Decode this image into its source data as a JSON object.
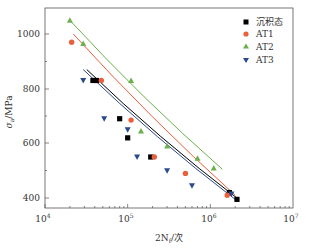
{
  "chart_data": {
    "type": "scatter",
    "title": "",
    "xlabel": "2N_f/次",
    "ylabel": "σ_a/MPa",
    "xscale": "log",
    "xlim": [
      10000,
      10000000
    ],
    "ylim": [
      375,
      1070
    ],
    "x_ticks": [
      "10^4",
      "10^5",
      "10^6",
      "10^7"
    ],
    "y_ticks": [
      400,
      600,
      800,
      1000
    ],
    "grid": false,
    "legend_position": "top-right",
    "series": [
      {
        "name": "沉积态",
        "marker": "square",
        "color": "#000000",
        "points": [
          [
            38000,
            830
          ],
          [
            42000,
            830
          ],
          [
            80000,
            690
          ],
          [
            100000,
            620
          ],
          [
            190000,
            550
          ],
          [
            1700000,
            420
          ],
          [
            2100000,
            395
          ]
        ],
        "fit": [
          [
            32000,
            870
          ],
          [
            2200000,
            395
          ]
        ]
      },
      {
        "name": "AT1",
        "marker": "circle",
        "color": "#e8603c",
        "points": [
          [
            21000,
            970
          ],
          [
            48000,
            830
          ],
          [
            110000,
            685
          ],
          [
            210000,
            550
          ],
          [
            500000,
            490
          ],
          [
            1600000,
            410
          ]
        ],
        "fit": [
          [
            22000,
            1000
          ],
          [
            2000000,
            410
          ]
        ]
      },
      {
        "name": "AT2",
        "marker": "triangle-up",
        "color": "#6ab04c",
        "points": [
          [
            20000,
            1050
          ],
          [
            29000,
            965
          ],
          [
            110000,
            830
          ],
          [
            145000,
            645
          ],
          [
            300000,
            590
          ],
          [
            700000,
            545
          ],
          [
            1100000,
            510
          ]
        ],
        "fit": [
          [
            20000,
            1050
          ],
          [
            1400000,
            505
          ]
        ]
      },
      {
        "name": "AT3",
        "marker": "triangle-down",
        "color": "#2b4a8c",
        "points": [
          [
            29000,
            830
          ],
          [
            52000,
            690
          ],
          [
            100000,
            650
          ],
          [
            130000,
            550
          ],
          [
            300000,
            500
          ],
          [
            600000,
            445
          ],
          [
            1800000,
            415
          ]
        ],
        "fit": [
          [
            29000,
            870
          ],
          [
            2000000,
            395
          ]
        ]
      }
    ]
  },
  "axes": {
    "x_label_prefix": "2N",
    "x_label_sub": "f",
    "x_label_suffix": "/次",
    "y_label_main": "σ",
    "y_label_sub": "a",
    "y_label_suffix": "/MPa",
    "y_tick_labels": [
      "1000",
      "800",
      "600",
      "400"
    ],
    "x_tick_bases": [
      "10",
      "10",
      "10",
      "10"
    ],
    "x_tick_exps": [
      "4",
      "5",
      "6",
      "7"
    ]
  },
  "legend": {
    "items": [
      {
        "label": "沉积态"
      },
      {
        "label": "AT1"
      },
      {
        "label": "AT2"
      },
      {
        "label": "AT3"
      }
    ]
  }
}
